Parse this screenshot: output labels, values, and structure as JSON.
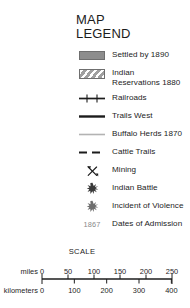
{
  "title": {
    "line1": "MAP",
    "line2": "LEGEND"
  },
  "legend": {
    "entries": [
      {
        "symbol": "area-solid-gray",
        "label": "Settled by 1890",
        "color": "#8d8d8d"
      },
      {
        "symbol": "area-hatched",
        "label": "Indian\nReservations 1880",
        "color": "#a8a8a8"
      },
      {
        "symbol": "railroad-line",
        "label": "Railroads",
        "color": "#1c1c1c"
      },
      {
        "symbol": "solid-thick-line",
        "label": "Trails West",
        "color": "#1c1c1c"
      },
      {
        "symbol": "thin-gray-line",
        "label": "Buffalo Herds 1870",
        "color": "#b3b3b3"
      },
      {
        "symbol": "dashed-line",
        "label": "Cattle Trails",
        "color": "#1c1c1c"
      },
      {
        "symbol": "mining-pick-icon",
        "label": "Mining",
        "color": "#1c1c1c"
      },
      {
        "symbol": "starburst-dark",
        "label": "Indian Battle",
        "color": "#3a3a3a"
      },
      {
        "symbol": "starburst-gray",
        "label": "Incident of Violence",
        "color": "#6e6e6e"
      },
      {
        "symbol": "date-text",
        "label": "Dates of Admission",
        "color": "#8a8a8a",
        "symbol_text": "1867"
      }
    ]
  },
  "scale": {
    "caption": "SCALE",
    "miles": {
      "unit_label": "miles",
      "zero": "0",
      "ticks": [
        {
          "value": 50,
          "label": "50"
        },
        {
          "value": 100,
          "label": "100"
        },
        {
          "value": 150,
          "label": "150"
        },
        {
          "value": 200,
          "label": "200"
        },
        {
          "value": 250,
          "label": "250"
        }
      ],
      "max": 250
    },
    "kilometers": {
      "unit_label": "kilometers",
      "zero": "0",
      "ticks": [
        {
          "value": 100,
          "label": "100"
        },
        {
          "value": 200,
          "label": "200"
        },
        {
          "value": 300,
          "label": "300"
        },
        {
          "value": 400,
          "label": "400"
        }
      ],
      "max": 402
    }
  }
}
